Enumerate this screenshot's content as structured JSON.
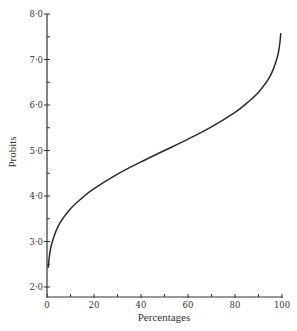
{
  "chart_data": {
    "type": "line",
    "title": "",
    "xlabel": "Percentages",
    "ylabel": "Probits",
    "xlim": [
      0,
      100
    ],
    "ylim": [
      2.0,
      8.0
    ],
    "x_ticks": [
      0,
      20,
      40,
      60,
      80,
      100
    ],
    "x_minor_ticks": [
      10,
      30,
      50,
      70,
      90
    ],
    "y_ticks": [
      2.0,
      3.0,
      4.0,
      5.0,
      6.0,
      7.0,
      8.0
    ],
    "y_tick_labels": [
      "2·0",
      "3·0",
      "4·0",
      "5·0",
      "6·0",
      "7·0",
      "8·0"
    ],
    "y_minor_ticks": [
      2.5,
      3.5,
      4.5,
      5.5,
      6.5,
      7.5
    ],
    "grid": false,
    "legend": null,
    "series": [
      {
        "name": "Probit transformation",
        "x": [
          0.5,
          1,
          2,
          5,
          10,
          15,
          20,
          30,
          40,
          50,
          60,
          70,
          80,
          85,
          90,
          95,
          98,
          99,
          99.5
        ],
        "y": [
          2.42,
          2.67,
          2.95,
          3.36,
          3.72,
          3.96,
          4.16,
          4.48,
          4.75,
          5.0,
          5.25,
          5.52,
          5.84,
          6.04,
          6.28,
          6.64,
          7.05,
          7.33,
          7.58
        ]
      }
    ],
    "colors": {
      "line": "#2b2b2b",
      "axis": "#333333"
    }
  }
}
